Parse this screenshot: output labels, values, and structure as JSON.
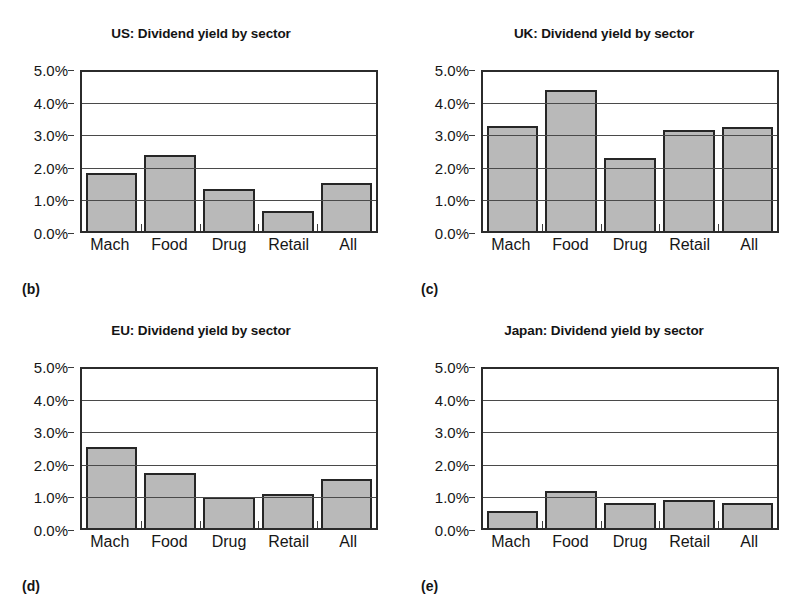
{
  "figure": {
    "categories": [
      "Mach",
      "Food",
      "Drug",
      "Retail",
      "All"
    ],
    "y_ticks": [
      "0.0%",
      "1.0%",
      "2.0%",
      "3.0%",
      "4.0%",
      "5.0%"
    ],
    "bar_fill_color": "#b9b9b9",
    "bar_border_color": "#262626",
    "axis_color": "#2b2b2b"
  },
  "panels": [
    {
      "key": "b",
      "panel_label": "(b)",
      "chart_data": {
        "type": "bar",
        "title": "US: Dividend yield by sector",
        "categories": [
          "Mach",
          "Food",
          "Drug",
          "Retail",
          "All"
        ],
        "values": [
          1.82,
          2.4,
          1.33,
          0.62,
          1.52
        ],
        "value_labels": [
          "1.8%",
          "2.4%",
          "1.3%",
          "0.6%",
          "1.5%"
        ],
        "xlabel": "",
        "ylabel": "",
        "ylim": [
          0,
          5
        ],
        "ytick_values": [
          0,
          1,
          2,
          3,
          4,
          5
        ],
        "ytick_labels": [
          "0.0%",
          "1.0%",
          "2.0%",
          "3.0%",
          "4.0%",
          "5.0%"
        ],
        "grid": true,
        "legend": false
      }
    },
    {
      "key": "c",
      "panel_label": "(c)",
      "chart_data": {
        "type": "bar",
        "title": "UK: Dividend yield by sector",
        "categories": [
          "Mach",
          "Food",
          "Drug",
          "Retail",
          "All"
        ],
        "values": [
          3.3,
          4.45,
          2.3,
          3.17,
          3.28
        ],
        "value_labels": [
          "3.3%",
          "4.4%",
          "2.3%",
          "3.2%",
          "3.3%"
        ],
        "xlabel": "",
        "ylabel": "",
        "ylim": [
          0,
          5
        ],
        "ytick_values": [
          0,
          1,
          2,
          3,
          4,
          5
        ],
        "ytick_labels": [
          "0.0%",
          "1.0%",
          "2.0%",
          "3.0%",
          "4.0%",
          "5.0%"
        ],
        "grid": true,
        "legend": false
      }
    },
    {
      "key": "d",
      "panel_label": "(d)",
      "chart_data": {
        "type": "bar",
        "title": "EU: Dividend yield by sector",
        "categories": [
          "Mach",
          "Food",
          "Drug",
          "Retail",
          "All"
        ],
        "values": [
          2.55,
          1.73,
          0.97,
          1.07,
          1.55
        ],
        "value_labels": [
          "2.6%",
          "1.7%",
          "1.0%",
          "1.1%",
          "1.6%"
        ],
        "xlabel": "",
        "ylabel": "",
        "ylim": [
          0,
          5
        ],
        "ytick_values": [
          0,
          1,
          2,
          3,
          4,
          5
        ],
        "ytick_labels": [
          "0.0%",
          "1.0%",
          "2.0%",
          "3.0%",
          "4.0%",
          "5.0%"
        ],
        "grid": true,
        "legend": false
      }
    },
    {
      "key": "e",
      "panel_label": "(e)",
      "chart_data": {
        "type": "bar",
        "title": "Japan: Dividend yield by sector",
        "categories": [
          "Mach",
          "Food",
          "Drug",
          "Retail",
          "All"
        ],
        "values": [
          0.55,
          1.15,
          0.8,
          0.88,
          0.8
        ],
        "value_labels": [
          "0.6%",
          "1.2%",
          "0.8%",
          "0.9%",
          "0.8%"
        ],
        "xlabel": "",
        "ylabel": "",
        "ylim": [
          0,
          5
        ],
        "ytick_values": [
          0,
          1,
          2,
          3,
          4,
          5
        ],
        "ytick_labels": [
          "0.0%",
          "1.0%",
          "2.0%",
          "3.0%",
          "4.0%",
          "5.0%"
        ],
        "grid": true,
        "legend": false
      }
    }
  ]
}
